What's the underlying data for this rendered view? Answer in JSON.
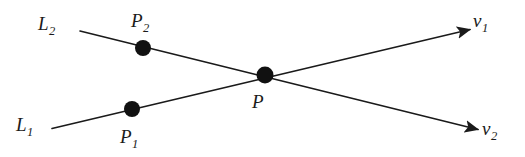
{
  "figure": {
    "background_color": "#ffffff",
    "stroke_color": "#1a1a1a",
    "dot_color": "#111111",
    "line_width": 1.6,
    "dot_radius": 8,
    "labels": {
      "line1": {
        "base": "L",
        "sub": "1"
      },
      "line2": {
        "base": "L",
        "sub": "2"
      },
      "point1": {
        "base": "P",
        "sub": "1"
      },
      "point2": {
        "base": "P",
        "sub": "2"
      },
      "intersection": {
        "base": "P",
        "sub": ""
      },
      "vector1": {
        "base": "ν",
        "sub": "1"
      },
      "vector2": {
        "base": "ν",
        "sub": "2"
      }
    },
    "geometry": {
      "line1": {
        "x1": 52,
        "y1": 128.5,
        "x2": 470,
        "y2": 29.5
      },
      "line2": {
        "x1": 80,
        "y1": 31,
        "x2": 478,
        "y2": 129.5
      },
      "dots": [
        {
          "name": "P2",
          "cx": 143,
          "cy": 48
        },
        {
          "name": "P1",
          "cx": 132,
          "cy": 109
        },
        {
          "name": "P",
          "cx": 265,
          "cy": 75
        }
      ],
      "arrowheads": [
        {
          "name": "v1",
          "tip_x": 470,
          "tip_y": 29.5
        },
        {
          "name": "v2",
          "tip_x": 478,
          "tip_y": 129.5
        }
      ]
    },
    "label_positions": {
      "line2": {
        "left": 38,
        "top": 14
      },
      "point2": {
        "left": 131,
        "top": 11
      },
      "line1": {
        "left": 16,
        "top": 115
      },
      "point1": {
        "left": 120,
        "top": 127
      },
      "intersection": {
        "left": 252,
        "top": 92
      },
      "vector1": {
        "left": 473,
        "top": 11
      },
      "vector2": {
        "left": 482,
        "top": 119
      }
    }
  }
}
